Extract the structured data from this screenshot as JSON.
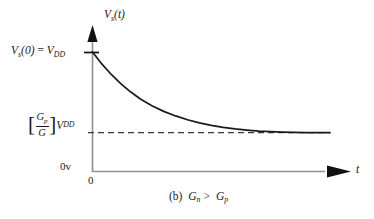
{
  "figure": {
    "background_color": "#ffffff",
    "axis_color": "#8f8f8f",
    "curve_color": "#1a1a1a",
    "dash_color": "#3a3a3a",
    "text_color": "#1a1a1a"
  },
  "labels": {
    "y_axis_title_main": "V",
    "y_axis_title_sub": "s",
    "y_axis_title_arg": "(t)",
    "initial_lhs_main": "V",
    "initial_lhs_sub": "s",
    "initial_lhs_arg": "(0)",
    "initial_eq": "=",
    "initial_rhs_main": "V",
    "initial_rhs_sub": "DD",
    "asymptote_bracket_open": "[",
    "asymptote_numerator_main": "G",
    "asymptote_numerator_sub": "p",
    "asymptote_denominator": "G",
    "asymptote_bracket_close": "]",
    "asymptote_rhs_main": "V",
    "asymptote_rhs_sub": "DD",
    "zero_volt": "0v",
    "origin": "0",
    "t_axis": "t"
  },
  "caption": {
    "index": "(b)",
    "lhs_main": "G",
    "lhs_sub": "n",
    "relation": ">",
    "rhs_main": "G",
    "rhs_sub": "p"
  },
  "chart_data": {
    "type": "line",
    "title": "",
    "subtitle": "(b)  G_n > G_p",
    "xlabel": "t",
    "ylabel": "V_s(t)",
    "grid": false,
    "legend": null,
    "xlim": [
      0,
      1
    ],
    "ylim": [
      0,
      1
    ],
    "y_tick_labels": [
      "0v",
      "[G_p/G]V_DD",
      "V_s(0) = V_DD"
    ],
    "y_tick_values": [
      0.0,
      0.325,
      1.0
    ],
    "x_tick_labels": [
      "0"
    ],
    "x_tick_values": [
      0.0
    ],
    "annotations": [
      {
        "text": "V_s(0) = V_DD",
        "kind": "y-axis-tick-label",
        "y": 1.0
      },
      {
        "text": "[G_p/G]V_DD",
        "kind": "asymptote-label",
        "y": 0.325
      },
      {
        "text": "0v",
        "kind": "axis-origin-label",
        "y": 0.0
      }
    ],
    "series": [
      {
        "name": "V_s(t) exponential decay",
        "style": "solid",
        "color": "#1a1a1a",
        "description": "V_s(t) = [G_p/G]V_DD + (V_DD - [G_p/G]V_DD) * exp(-t/tau)",
        "x": [
          0.0,
          0.04,
          0.08,
          0.12,
          0.16,
          0.2,
          0.25,
          0.3,
          0.35,
          0.4,
          0.45,
          0.5,
          0.55,
          0.6,
          0.65,
          0.7,
          0.8,
          0.9,
          1.0
        ],
        "y": [
          1.0,
          0.898,
          0.81,
          0.733,
          0.667,
          0.609,
          0.551,
          0.503,
          0.465,
          0.433,
          0.407,
          0.386,
          0.369,
          0.356,
          0.346,
          0.338,
          0.33,
          0.326,
          0.325
        ]
      },
      {
        "name": "asymptote [G_p/G]V_DD",
        "style": "dashed",
        "color": "#3a3a3a",
        "x": [
          0.0,
          1.0
        ],
        "y": [
          0.325,
          0.325
        ]
      }
    ]
  }
}
